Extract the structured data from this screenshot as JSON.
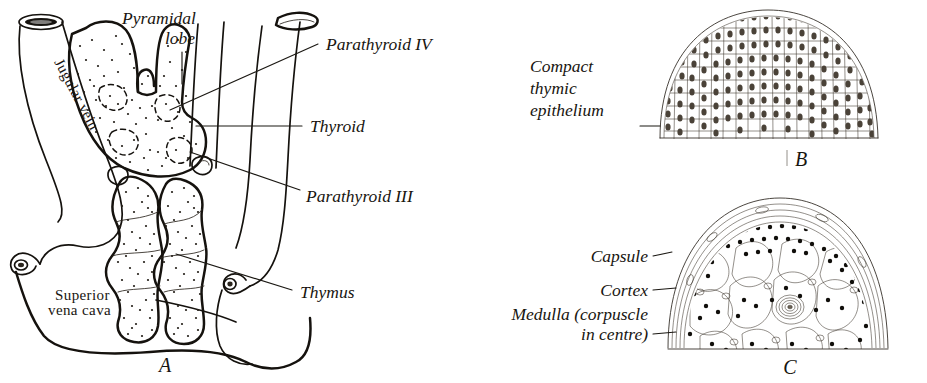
{
  "figure": {
    "kind": "anatomical-plate",
    "panels": [
      {
        "id": "A",
        "letter": "A",
        "description": "Ventral view of thyroid gland, parathyroids and thymus with great veins",
        "labels": [
          {
            "key": "pyramidal_lobe",
            "text": "Pyramidal\nlobe",
            "lines": [
              "Pyramidal",
              "lobe"
            ],
            "style": "italic"
          },
          {
            "key": "parathyroid_iv",
            "text": "Parathyroid IV",
            "style": "italic"
          },
          {
            "key": "thyroid",
            "text": "Thyroid",
            "style": "italic"
          },
          {
            "key": "parathyroid_iii",
            "text": "Parathyroid III",
            "style": "italic"
          },
          {
            "key": "thymus",
            "text": "Thymus",
            "style": "italic"
          },
          {
            "key": "jugular_vein",
            "text": "Jugular vein",
            "style": "roman-rotated"
          },
          {
            "key": "superior_vena_cava",
            "text": "Superior\nvena cava",
            "lines": [
              "Superior",
              "vena cava"
            ],
            "style": "roman"
          }
        ]
      },
      {
        "id": "B",
        "letter": "B",
        "description": "Compact thymic epithelium of polygonal cells each with an oval nucleus",
        "labels": [
          {
            "key": "compact_thymic_epithelium",
            "text": "Compact\nthymic\nepithelium",
            "lines": [
              "Compact",
              "thymic",
              "epithelium"
            ],
            "style": "italic"
          }
        ]
      },
      {
        "id": "C",
        "letter": "C",
        "description": "Differentiated thymus lobule showing capsule, dark-staining cortex and pale medulla containing a Hassall's corpuscle",
        "labels": [
          {
            "key": "capsule",
            "text": "Capsule",
            "style": "italic"
          },
          {
            "key": "cortex",
            "text": "Cortex",
            "style": "italic"
          },
          {
            "key": "medulla",
            "text": "Medulla (corpuscle\nin centre)",
            "lines": [
              "Medulla (corpuscle",
              "in centre)"
            ],
            "style": "italic"
          }
        ]
      }
    ]
  },
  "colors": {
    "ink": "#15120e",
    "paper": "#ffffff",
    "stipple": "#241f18",
    "nucleus": "#4a4238"
  }
}
